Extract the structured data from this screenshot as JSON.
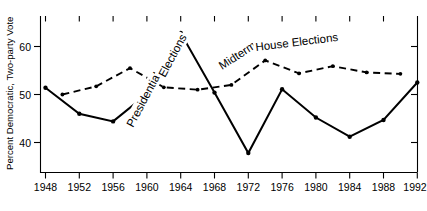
{
  "chart_data": {
    "type": "line",
    "title": "",
    "xlabel": "",
    "ylabel": "Percent Democratic, Two-party Vote",
    "xlim": [
      1947,
      1993
    ],
    "ylim": [
      33.5,
      66.5
    ],
    "grid": false,
    "legend": "inline-annotations",
    "xticks": [
      1948,
      1952,
      1956,
      1960,
      1964,
      1968,
      1972,
      1976,
      1980,
      1984,
      1988,
      1992
    ],
    "yticks": [
      40,
      50,
      60
    ],
    "series": [
      {
        "name": "Presidential Elections",
        "style": "solid",
        "marker": "filled-circle",
        "x": [
          1948,
          1952,
          1956,
          1960,
          1964,
          1968,
          1972,
          1976,
          1980,
          1984,
          1988,
          1992
        ],
        "values": [
          51.4,
          46.0,
          44.4,
          50.1,
          62.8,
          50.4,
          37.8,
          51.1,
          45.2,
          41.2,
          44.7,
          52.5
        ]
      },
      {
        "name": "Midterm House Elections",
        "style": "dashed",
        "marker": "filled-circle",
        "x": [
          1950,
          1954,
          1958,
          1962,
          1966,
          1970,
          1974,
          1978,
          1982,
          1986,
          1990
        ],
        "values": [
          50.0,
          51.7,
          55.5,
          51.5,
          51.0,
          52.0,
          57.1,
          54.4,
          55.9,
          54.6,
          54.3
        ]
      }
    ],
    "annotations": [
      {
        "text": "Presidential",
        "series": "Presidential Elections",
        "rotation": -60
      },
      {
        "text": "Elections",
        "series": "Presidential Elections",
        "rotation": -60
      },
      {
        "text": "Midterm",
        "series": "Midterm House Elections",
        "rotation": -30
      },
      {
        "text": "House Elections",
        "series": "Midterm House Elections",
        "rotation": -7
      }
    ]
  },
  "axis": {
    "y_title": "Percent Democratic, Two-party Vote",
    "y_tick_labels": [
      "60",
      "50",
      "40"
    ],
    "x_tick_labels": [
      "1948",
      "1952",
      "1956",
      "1960",
      "1964",
      "1968",
      "1972",
      "1976",
      "1980",
      "1984",
      "1988",
      "1992"
    ]
  },
  "annotations": {
    "presidential_line1": "Presidential",
    "presidential_line2": "Elections",
    "midterm_line1": "Midterm",
    "midterm_line2": "House Elections"
  },
  "colors": {
    "ink": "#000000",
    "background": "#ffffff"
  }
}
